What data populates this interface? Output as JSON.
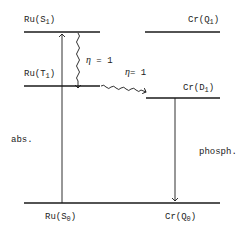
{
  "diagram": {
    "type": "energy-level-diagram",
    "levels": {
      "ru_s1": {
        "base": "Ru(S",
        "sub": "1",
        "close": ")"
      },
      "ru_t1": {
        "base": "Ru(T",
        "sub": "1",
        "close": ")"
      },
      "ru_s0": {
        "base": "Ru(S",
        "sub": "0",
        "close": ")"
      },
      "cr_q1": {
        "base": "Cr(Q",
        "sub": "1",
        "close": ")"
      },
      "cr_d1": {
        "base": "Cr(D",
        "sub": "1",
        "close": ")"
      },
      "cr_q0": {
        "base": "Cr(Q",
        "sub": "0",
        "close": ")"
      }
    },
    "transitions": {
      "absorption": "abs.",
      "isc_eta_symbol": "η",
      "isc_eta_value": " = 1",
      "energy_transfer_eta_symbol": "η",
      "energy_transfer_eta_value": "= 1",
      "phosphorescence": "phosph."
    },
    "colors": {
      "line": "#1a1a1a",
      "text": "#222222",
      "background": "#ffffff"
    }
  }
}
